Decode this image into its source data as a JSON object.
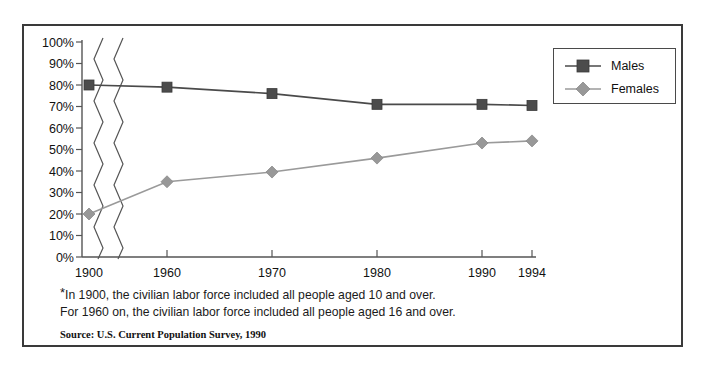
{
  "chart_data": {
    "type": "line",
    "title": "",
    "subtitle": "",
    "xlabel": "",
    "ylabel": "",
    "x": [
      "1900",
      "1960",
      "1970",
      "1980",
      "1990",
      "1994"
    ],
    "categories": [
      "1900",
      "1960",
      "1970",
      "1980",
      "1990",
      "1994"
    ],
    "series": [
      {
        "name": "Males",
        "values": [
          80,
          79,
          76,
          71,
          71,
          70.5
        ],
        "color": "#4c4c4c",
        "marker": "square"
      },
      {
        "name": "Females",
        "values": [
          20,
          35,
          39.5,
          46,
          53,
          54
        ],
        "color": "#989898",
        "marker": "diamond"
      }
    ],
    "ylim": [
      0,
      100
    ],
    "ytick_labels": [
      "0%",
      "10%",
      "20%",
      "30%",
      "40%",
      "50%",
      "60%",
      "70%",
      "80%",
      "90%",
      "100%"
    ],
    "ytick_values": [
      0,
      10,
      20,
      30,
      40,
      50,
      60,
      70,
      80,
      90,
      100
    ],
    "xtick_labels": [
      "1900",
      "1960",
      "1970",
      "1980",
      "1990",
      "1994"
    ],
    "grid": false,
    "axis_break": true,
    "axis_break_note": "double zigzag break between 1900 and 1960",
    "legend_position": "top-right"
  },
  "legend": {
    "entries": [
      {
        "label": "Males",
        "marker": "square",
        "color": "#4c4c4c"
      },
      {
        "label": "Females",
        "marker": "diamond",
        "color": "#989898"
      }
    ]
  },
  "footnotes": {
    "star": "*",
    "line1": "In 1900, the civilian labor force included all people aged 10 and over.",
    "line2": "For 1960 on, the civilian labor force included all people aged 16 and over.",
    "source": "Source: U.S. Current Population Survey, 1990"
  }
}
